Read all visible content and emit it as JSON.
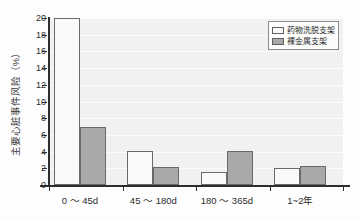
{
  "chart_data": {
    "type": "bar",
    "title": "",
    "subtitle": "",
    "xlabel": "",
    "ylabel": "主要心脏事件风险（%）",
    "categories": [
      "0 ～ 45d",
      "45 ～ 180d",
      "180 ～ 365d",
      "1~2年"
    ],
    "series": [
      {
        "name": "药物洗脱支架",
        "values": [
          20.0,
          4.1,
          1.6,
          2.0
        ],
        "color": "#fafafa"
      },
      {
        "name": "裸金属支架",
        "values": [
          7.0,
          2.1,
          4.1,
          2.3
        ],
        "color": "#a9a9a9"
      }
    ],
    "ylim": [
      0,
      20
    ],
    "yticks": [
      0,
      2,
      4,
      6,
      8,
      10,
      12,
      14,
      16,
      18,
      20
    ],
    "ytick_labels": [
      "0",
      "2",
      "4",
      "6",
      "8",
      "10",
      "12",
      "14",
      "16",
      "18",
      "20"
    ],
    "grid": true,
    "grid_axis": "y",
    "legend_position": "upper right",
    "plot_background": "#f1f1f1",
    "axis_color": "#2e2e2e"
  },
  "legend": {
    "entries": [
      {
        "label": "药物洗脱支架",
        "swatch": "light"
      },
      {
        "label": "裸金属支架",
        "swatch": "dark"
      }
    ]
  }
}
